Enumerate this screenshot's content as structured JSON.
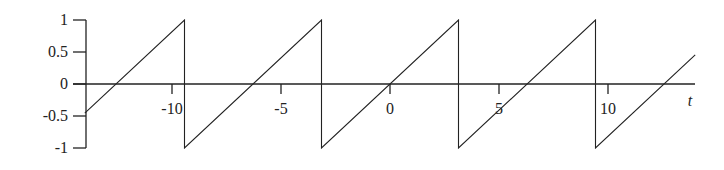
{
  "chart_data": {
    "type": "line",
    "title": "",
    "xlabel": "t",
    "ylabel": "",
    "function": "sawtooth, period 2π: f(t) = (t - 2πk)/π on (-π + 2πk, π + 2πk)",
    "xlim": [
      -14,
      14
    ],
    "ylim": [
      -1,
      1
    ],
    "grid": false,
    "legend": null,
    "x_ticks": [
      -10,
      -5,
      0,
      5,
      10
    ],
    "x_tick_labels": [
      "-10",
      "-5",
      "0",
      "5",
      "10"
    ],
    "y_ticks": [
      1,
      0.5,
      0,
      -0.5,
      -1
    ],
    "y_tick_labels": [
      "1",
      "0.5",
      "0",
      "-0.5",
      "-1"
    ],
    "series": [
      {
        "name": "sawtooth",
        "color": "#222222",
        "points": [
          [
            -14,
            -0.456
          ],
          [
            -9.425,
            1
          ],
          [
            -9.425,
            -1
          ],
          [
            -3.1416,
            1
          ],
          [
            -3.1416,
            -1
          ],
          [
            3.1416,
            1
          ],
          [
            3.1416,
            -1
          ],
          [
            9.425,
            1
          ],
          [
            9.425,
            -1
          ],
          [
            14,
            0.456
          ]
        ]
      }
    ]
  },
  "layout": {
    "origin_px": [
      390,
      84
    ],
    "x_px_per_unit": 21.8,
    "y_px_per_unit": 64,
    "y_axis_x_px": 86,
    "x_axis_end_px": 695
  }
}
